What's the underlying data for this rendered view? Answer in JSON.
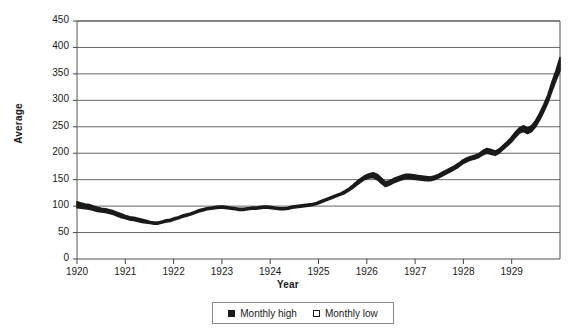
{
  "chart_data": {
    "type": "area",
    "title": "",
    "xlabel": "Year",
    "ylabel": "Average",
    "ylim": [
      0,
      450
    ],
    "ytick_step": 50,
    "yticks": [
      "0",
      "50",
      "100",
      "150",
      "200",
      "250",
      "300",
      "350",
      "400",
      "450"
    ],
    "xticks": [
      "1920",
      "1921",
      "1922",
      "1923",
      "1924",
      "1925",
      "1926",
      "1927",
      "1928",
      "1929"
    ],
    "xlim": [
      1920,
      1930
    ],
    "grid": "horizontal",
    "legend_position": "bottom",
    "legend": [
      "Monthly high",
      "Monthly low"
    ],
    "series": [
      {
        "name": "Monthly high",
        "color": "#1a1a1a",
        "values": [
          108,
          106,
          104,
          103,
          100,
          98,
          96,
          95,
          93,
          91,
          88,
          85,
          82,
          80,
          79,
          77,
          75,
          73,
          71,
          70,
          70,
          72,
          74,
          75,
          78,
          80,
          83,
          85,
          87,
          90,
          93,
          95,
          97,
          98,
          99,
          100,
          100,
          99,
          98,
          97,
          96,
          96,
          97,
          98,
          98,
          99,
          100,
          100,
          99,
          98,
          97,
          97,
          98,
          100,
          101,
          102,
          103,
          104,
          105,
          107,
          110,
          113,
          116,
          119,
          122,
          125,
          129,
          134,
          140,
          147,
          153,
          158,
          161,
          163,
          160,
          153,
          146,
          148,
          152,
          155,
          158,
          160,
          160,
          159,
          158,
          157,
          156,
          155,
          157,
          160,
          164,
          168,
          172,
          176,
          181,
          187,
          191,
          194,
          196,
          199,
          205,
          209,
          207,
          204,
          208,
          215,
          222,
          230,
          240,
          248,
          252,
          248,
          252,
          262,
          276,
          292,
          310,
          334,
          356,
          381
        ]
      },
      {
        "name": "Monthly low",
        "color": "#ffffff",
        "values": [
          97,
          96,
          95,
          94,
          92,
          90,
          89,
          88,
          86,
          84,
          81,
          78,
          76,
          74,
          73,
          71,
          69,
          68,
          67,
          66,
          66,
          68,
          70,
          71,
          74,
          76,
          79,
          81,
          83,
          86,
          89,
          91,
          93,
          94,
          95,
          96,
          96,
          95,
          94,
          93,
          92,
          92,
          93,
          94,
          94,
          95,
          96,
          96,
          95,
          94,
          93,
          93,
          94,
          96,
          97,
          98,
          99,
          100,
          101,
          103,
          106,
          109,
          112,
          115,
          118,
          121,
          124,
          129,
          134,
          140,
          146,
          151,
          153,
          154,
          150,
          143,
          137,
          140,
          144,
          147,
          150,
          152,
          152,
          151,
          150,
          149,
          148,
          148,
          150,
          153,
          157,
          161,
          165,
          169,
          174,
          180,
          184,
          187,
          189,
          192,
          197,
          200,
          198,
          196,
          200,
          207,
          214,
          221,
          230,
          238,
          241,
          237,
          241,
          250,
          263,
          278,
          295,
          317,
          337,
          356
        ]
      }
    ]
  },
  "axes": {
    "y_title": "Average",
    "x_title": "Year"
  },
  "legend": {
    "items": [
      {
        "label": "Monthly high",
        "marker": "filled-square"
      },
      {
        "label": "Monthly low",
        "marker": "open-square"
      }
    ]
  }
}
